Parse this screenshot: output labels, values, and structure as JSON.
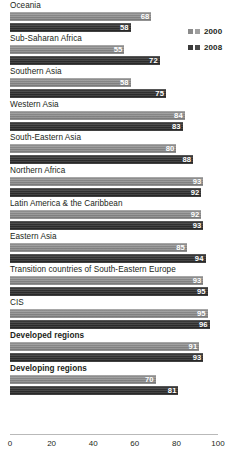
{
  "legend": {
    "position": "top-right",
    "entries": [
      {
        "label": "2000",
        "swatch": "legend-swatch-light",
        "color": "#8b8b8b"
      },
      {
        "label": "2008",
        "swatch": "legend-swatch-dark",
        "color": "#333333"
      }
    ]
  },
  "axis": {
    "ticks": [
      "0",
      "20",
      "40",
      "60",
      "80",
      "100"
    ],
    "min": 0,
    "max": 100
  },
  "chart_data": {
    "type": "bar",
    "orientation": "horizontal",
    "title": "",
    "subtitle": "",
    "xlabel": "",
    "ylabel": "",
    "xlim": [
      0,
      100
    ],
    "grid": false,
    "legend_position": "top-right",
    "categories": [
      "Oceania",
      "Sub-Saharan Africa",
      "Southern Asia",
      "Western Asia",
      "South-Eastern Asia",
      "Northern Africa",
      "Latin America & the Caribbean",
      "Eastern Asia",
      "Transition countries of South-Eastern Europe",
      "CIS",
      "Developed regions",
      "Developing regions"
    ],
    "emphasized_categories": [
      "Developed regions",
      "Developing regions"
    ],
    "series": [
      {
        "name": "2000",
        "color": "#8b8b8b",
        "values": [
          68,
          55,
          58,
          84,
          80,
          93,
          92,
          85,
          93,
          95,
          91,
          70
        ]
      },
      {
        "name": "2008",
        "color": "#333333",
        "values": [
          58,
          72,
          75,
          83,
          88,
          92,
          93,
          94,
          95,
          96,
          93,
          81
        ]
      }
    ],
    "tick_labels": [
      "0",
      "20",
      "40",
      "60",
      "80",
      "100"
    ]
  }
}
